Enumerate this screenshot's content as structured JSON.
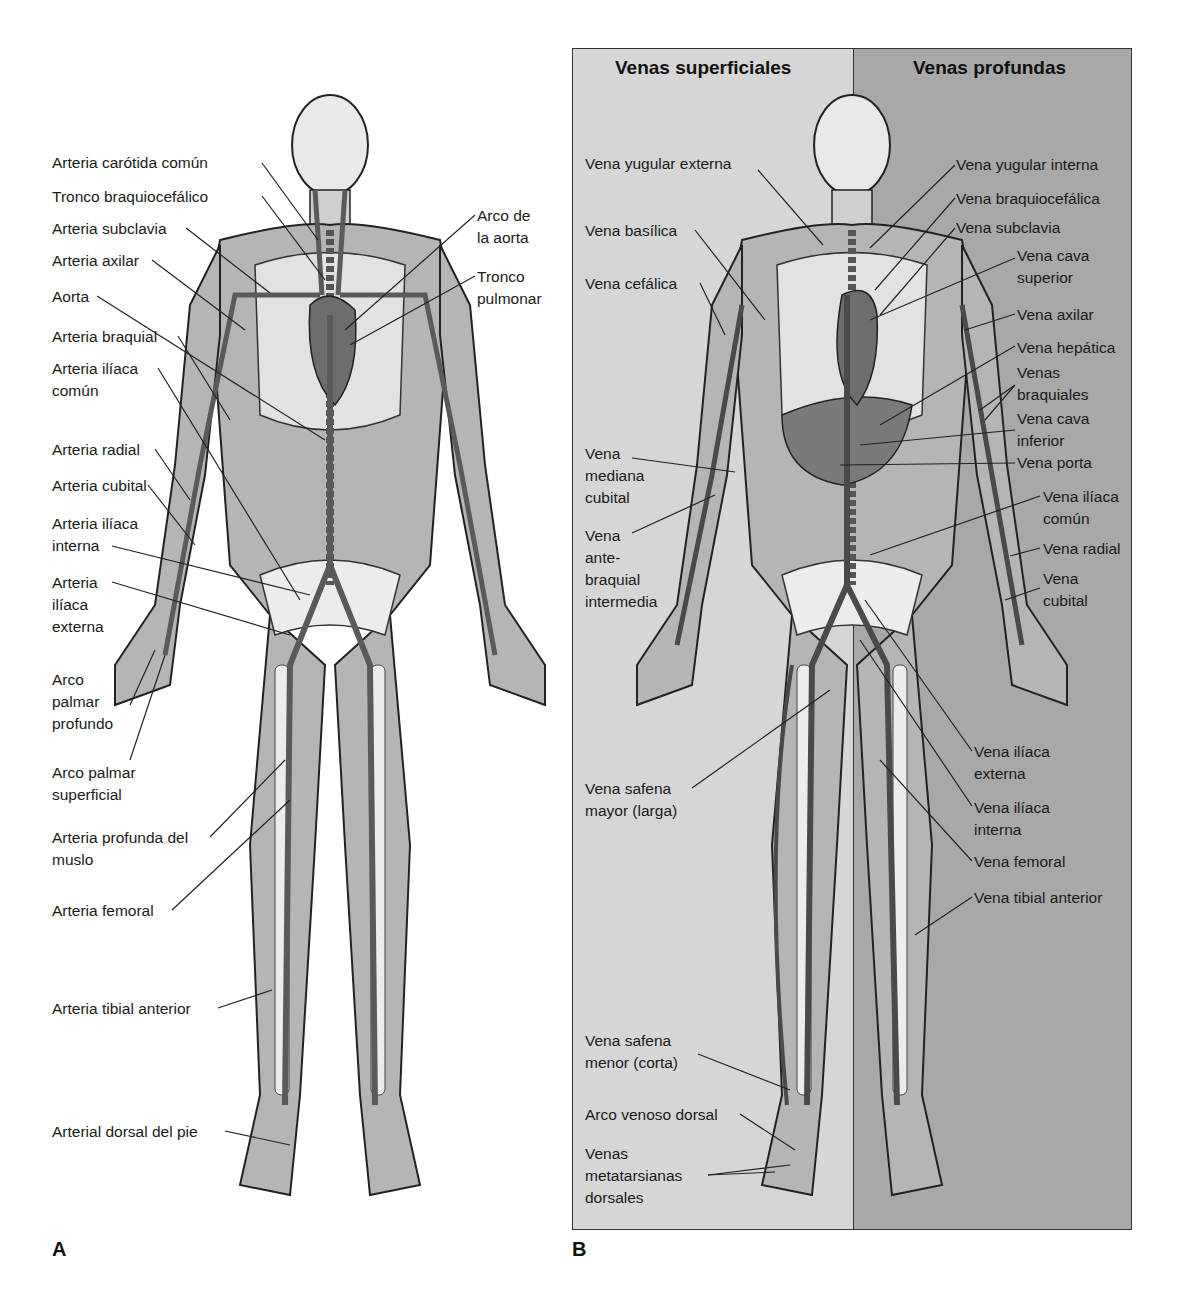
{
  "panels": {
    "A": {
      "letter": "A",
      "title": "Arterias",
      "labels": [
        {
          "text": "Arteria carótida común",
          "x": 52,
          "y": 152
        },
        {
          "text": "Tronco braquiocefálico",
          "x": 52,
          "y": 186
        },
        {
          "text": "Arteria subclavia",
          "x": 52,
          "y": 218
        },
        {
          "text": "Arteria axilar",
          "x": 52,
          "y": 250
        },
        {
          "text": "Aorta",
          "x": 52,
          "y": 286
        },
        {
          "text": "Arteria braquial",
          "x": 52,
          "y": 326
        },
        {
          "text": "Arteria ilíaca\ncomún",
          "x": 52,
          "y": 358
        },
        {
          "text": "Arteria radial",
          "x": 52,
          "y": 439
        },
        {
          "text": "Arteria cubital",
          "x": 52,
          "y": 475
        },
        {
          "text": "Arteria ilíaca\ninterna",
          "x": 52,
          "y": 513
        },
        {
          "text": "Arteria\nilíaca\nexterna",
          "x": 52,
          "y": 572
        },
        {
          "text": "Arco\npalmar\nprofundo",
          "x": 52,
          "y": 669
        },
        {
          "text": "Arco palmar\nsuperficial",
          "x": 52,
          "y": 762
        },
        {
          "text": "Arteria profunda del\nmuslo",
          "x": 52,
          "y": 827
        },
        {
          "text": "Arteria femoral",
          "x": 52,
          "y": 900
        },
        {
          "text": "Arteria tibial anterior",
          "x": 52,
          "y": 998
        },
        {
          "text": "Arterial dorsal del pie",
          "x": 52,
          "y": 1121
        },
        {
          "text": "Arco de\nla aorta",
          "x": 477,
          "y": 205
        },
        {
          "text": "Tronco\npulmonar",
          "x": 477,
          "y": 266
        }
      ]
    },
    "B": {
      "letter": "B",
      "headers": {
        "left": "Venas superficiales",
        "right": "Venas profundas"
      },
      "colors": {
        "superficial_bg": "#d6d6d6",
        "deep_bg": "#a8a8a8"
      },
      "labels": [
        {
          "text": "Vena yugular externa",
          "x": 585,
          "y": 153
        },
        {
          "text": "Vena basílica",
          "x": 585,
          "y": 220
        },
        {
          "text": "Vena cefálica",
          "x": 585,
          "y": 273
        },
        {
          "text": "Vena\nmediana\ncubital",
          "x": 585,
          "y": 443
        },
        {
          "text": "Vena\nante-\nbraquial\nintermedia",
          "x": 585,
          "y": 525
        },
        {
          "text": "Vena safena\nmayor (larga)",
          "x": 585,
          "y": 778
        },
        {
          "text": "Vena safena\nmenor (corta)",
          "x": 585,
          "y": 1030
        },
        {
          "text": "Arco venoso dorsal",
          "x": 585,
          "y": 1104
        },
        {
          "text": "Venas\nmetatarsianas\ndorsales",
          "x": 585,
          "y": 1143
        },
        {
          "text": "Vena yugular interna",
          "x": 956,
          "y": 154
        },
        {
          "text": "Vena braquiocefálica",
          "x": 956,
          "y": 188
        },
        {
          "text": "Vena subclavia",
          "x": 956,
          "y": 217
        },
        {
          "text": "Vena cava\nsuperior",
          "x": 1017,
          "y": 245
        },
        {
          "text": "Vena axilar",
          "x": 1017,
          "y": 304
        },
        {
          "text": "Vena hepática",
          "x": 1017,
          "y": 337
        },
        {
          "text": "Venas\nbraquiales",
          "x": 1017,
          "y": 362
        },
        {
          "text": "Vena cava\ninferior",
          "x": 1017,
          "y": 408
        },
        {
          "text": "Vena porta",
          "x": 1017,
          "y": 452
        },
        {
          "text": "Vena ilíaca\ncomún",
          "x": 1043,
          "y": 486
        },
        {
          "text": "Vena radial",
          "x": 1043,
          "y": 538
        },
        {
          "text": "Vena\ncubital",
          "x": 1043,
          "y": 568
        },
        {
          "text": "Vena ilíaca\nexterna",
          "x": 974,
          "y": 741
        },
        {
          "text": "Vena ilíaca\ninterna",
          "x": 974,
          "y": 797
        },
        {
          "text": "Vena femoral",
          "x": 974,
          "y": 851
        },
        {
          "text": "Vena tibial anterior",
          "x": 974,
          "y": 887
        }
      ]
    }
  }
}
